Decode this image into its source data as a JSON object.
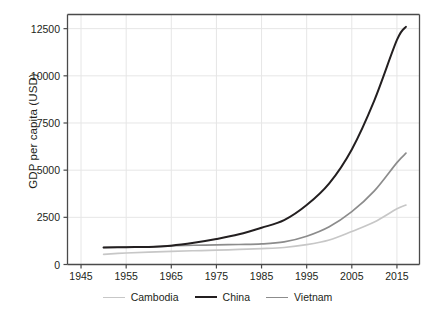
{
  "chart_data": {
    "type": "line",
    "title": "",
    "xlabel": "",
    "ylabel": "GDP per capita (USD)",
    "xlim": [
      1942,
      2020
    ],
    "ylim": [
      0,
      13250
    ],
    "grid": true,
    "legend_position": "bottom",
    "xticks": [
      1945,
      1955,
      1965,
      1975,
      1985,
      1995,
      2005,
      2015
    ],
    "yticks": [
      0,
      2500,
      5000,
      7500,
      10000,
      12500
    ],
    "x": [
      1950,
      1955,
      1960,
      1965,
      1970,
      1975,
      1980,
      1985,
      1990,
      1995,
      2000,
      2005,
      2010,
      2015,
      2017
    ],
    "series": [
      {
        "name": "Cambodia",
        "color": "#c7c7c7",
        "values": [
          540,
          610,
          660,
          700,
          730,
          760,
          800,
          840,
          900,
          1050,
          1300,
          1750,
          2250,
          2950,
          3150
        ]
      },
      {
        "name": "China",
        "color": "#231f20",
        "values": [
          900,
          920,
          930,
          1000,
          1150,
          1350,
          1600,
          1950,
          2350,
          3150,
          4300,
          6100,
          8700,
          11900,
          12600
        ]
      },
      {
        "name": "Vietnam",
        "color": "#8c8c8c",
        "values": [
          900,
          920,
          930,
          1000,
          1020,
          1040,
          1060,
          1090,
          1200,
          1500,
          2000,
          2800,
          3900,
          5400,
          5900
        ]
      }
    ]
  },
  "legend": {
    "items": [
      {
        "label": "Cambodia",
        "color": "#c7c7c7"
      },
      {
        "label": "China",
        "color": "#231f20"
      },
      {
        "label": "Vietnam",
        "color": "#8c8c8c"
      }
    ]
  }
}
